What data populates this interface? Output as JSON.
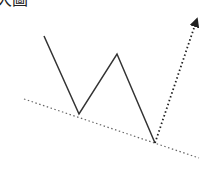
{
  "caption": "大圖",
  "diagram": {
    "type": "double-bottom-pattern",
    "colors": {
      "price_line": "#333333",
      "trendline": "#666666",
      "breakout_arrow": "#222222",
      "background": "#ffffff"
    },
    "price_path": [
      [
        44,
        36
      ],
      [
        79,
        114
      ],
      [
        117,
        54
      ],
      [
        155,
        143
      ]
    ],
    "trendline": [
      [
        24,
        99
      ],
      [
        199,
        158
      ]
    ],
    "breakout_arrow": {
      "from": [
        155,
        143
      ],
      "to": [
        197,
        17
      ]
    }
  }
}
